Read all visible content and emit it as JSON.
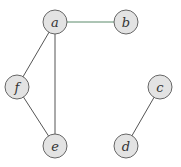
{
  "graph": {
    "nodes": [
      {
        "id": "a",
        "label": "a"
      },
      {
        "id": "b",
        "label": "b"
      },
      {
        "id": "c",
        "label": "c"
      },
      {
        "id": "d",
        "label": "d"
      },
      {
        "id": "e",
        "label": "e"
      },
      {
        "id": "f",
        "label": "f"
      }
    ],
    "edges": [
      {
        "from": "a",
        "to": "b"
      },
      {
        "from": "a",
        "to": "f"
      },
      {
        "from": "a",
        "to": "e"
      },
      {
        "from": "f",
        "to": "e"
      },
      {
        "from": "c",
        "to": "d"
      }
    ],
    "colors": {
      "node_fill": "#e3e3e3",
      "node_stroke": "#666666",
      "edge": "#555555",
      "edge_ab": "#5a8a6a",
      "label": "#333333"
    }
  }
}
